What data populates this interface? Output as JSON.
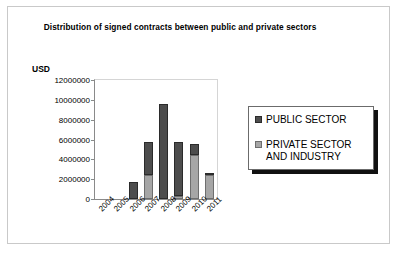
{
  "chart_data": {
    "type": "bar",
    "stacked": true,
    "title": "Distribution of signed contracts between public and\nprivate sectors",
    "xlabel": "",
    "ylabel": "USD",
    "ylim": [
      0,
      12000000
    ],
    "ytick_labels": [
      "12000000",
      "10000000",
      "8000000",
      "6000000",
      "4000000",
      "2000000",
      "0"
    ],
    "ytick_values": [
      12000000,
      10000000,
      8000000,
      6000000,
      4000000,
      2000000,
      0
    ],
    "grid": false,
    "legend_position": "right",
    "categories": [
      "2004",
      "2005",
      "2006",
      "2007",
      "2008",
      "2009",
      "2010",
      "2011"
    ],
    "series": [
      {
        "name": "PUBLIC SECTOR",
        "color": "#4d4d4d",
        "values": [
          0,
          0,
          1700000,
          3300000,
          9600000,
          5400000,
          1100000,
          200000
        ]
      },
      {
        "name": "PRIVATE SECTOR\nAND INDUSTRY",
        "color": "#a6a6a6",
        "values": [
          0,
          0,
          0,
          2400000,
          0,
          300000,
          4400000,
          2400000
        ]
      }
    ]
  },
  "legend": {
    "items": [
      {
        "label": "PUBLIC SECTOR"
      },
      {
        "label": "PRIVATE SECTOR\nAND INDUSTRY"
      }
    ]
  }
}
